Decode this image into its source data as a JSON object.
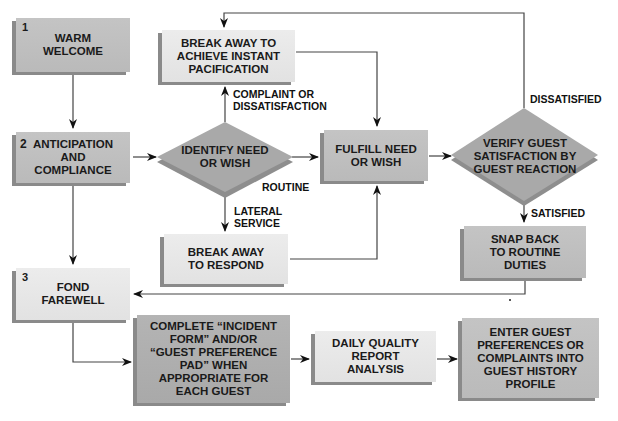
{
  "diagram": {
    "type": "flowchart",
    "nodes": {
      "warm_welcome": {
        "number": "1",
        "label": "WARM\nWELCOME",
        "shape": "box"
      },
      "anticipation": {
        "number": "2",
        "label": "ANTICIPATION\nAND\nCOMPLIANCE",
        "shape": "box"
      },
      "fond_farewell": {
        "number": "3",
        "label": "FOND\nFAREWELL",
        "shape": "box"
      },
      "break_away_pacification": {
        "label": "BREAK AWAY TO\nACHIEVE INSTANT\nPACIFICATION",
        "shape": "box"
      },
      "identify_need": {
        "label": "IDENTIFY NEED\nOR WISH",
        "shape": "diamond"
      },
      "fulfill_need": {
        "label": "FULFILL NEED\nOR WISH",
        "shape": "box"
      },
      "verify_guest": {
        "label": "VERIFY GUEST\nSATISFACTION BY\nGUEST REACTION",
        "shape": "diamond"
      },
      "break_away_respond": {
        "label": "BREAK AWAY\nTO RESPOND",
        "shape": "box"
      },
      "snap_back": {
        "label": "SNAP BACK\nTO ROUTINE\nDUTIES",
        "shape": "box"
      },
      "complete_form": {
        "label": "COMPLETE “INCIDENT\nFORM” AND/OR\n“GUEST PREFERENCE\nPAD” WHEN\nAPPROPRIATE FOR\nEACH GUEST",
        "shape": "box"
      },
      "daily_quality": {
        "label": "DAILY QUALITY\nREPORT\nANALYSIS",
        "shape": "box"
      },
      "enter_guest_prefs": {
        "label": "ENTER GUEST\nPREFERENCES OR\nCOMPLAINTS INTO\nGUEST HISTORY\nPROFILE",
        "shape": "box"
      }
    },
    "edge_labels": {
      "complaint": "COMPLAINT OR\nDISSATISFACTION",
      "routine": "ROUTINE",
      "lateral": "LATERAL\nSERVICE",
      "dissatisfied": "DISSATISFIED",
      "satisfied": "SATISFIED"
    },
    "edges": [
      {
        "from": "warm_welcome",
        "to": "anticipation"
      },
      {
        "from": "anticipation",
        "to": "identify_need"
      },
      {
        "from": "anticipation",
        "to": "fond_farewell"
      },
      {
        "from": "identify_need",
        "to": "break_away_pacification",
        "label": "COMPLAINT OR DISSATISFACTION"
      },
      {
        "from": "identify_need",
        "to": "fulfill_need",
        "label": "ROUTINE"
      },
      {
        "from": "identify_need",
        "to": "break_away_respond",
        "label": "LATERAL SERVICE"
      },
      {
        "from": "break_away_pacification",
        "to": "fulfill_need"
      },
      {
        "from": "break_away_respond",
        "to": "fulfill_need"
      },
      {
        "from": "fulfill_need",
        "to": "verify_guest"
      },
      {
        "from": "verify_guest",
        "to": "break_away_pacification",
        "label": "DISSATISFIED"
      },
      {
        "from": "verify_guest",
        "to": "snap_back",
        "label": "SATISFIED"
      },
      {
        "from": "snap_back",
        "to": "fond_farewell"
      },
      {
        "from": "fond_farewell",
        "to": "complete_form"
      },
      {
        "from": "complete_form",
        "to": "daily_quality"
      },
      {
        "from": "daily_quality",
        "to": "enter_guest_prefs"
      }
    ]
  },
  "colors": {
    "mid_gray": "#bdbdbd",
    "light_gray": "#e6e6e6",
    "dark_gray": "#adadad",
    "diamond": "#a8a8a8",
    "line": "#333333"
  }
}
